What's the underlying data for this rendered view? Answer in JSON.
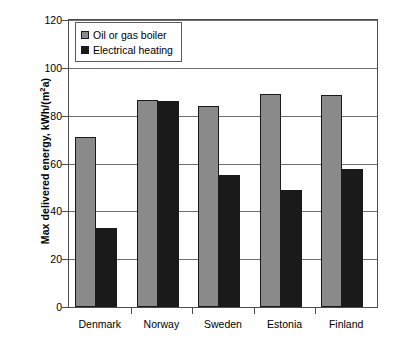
{
  "chart_data": {
    "type": "bar",
    "title": "",
    "xlabel": "",
    "ylabel": "Max delivered energy, kWh/(m2a)",
    "ylabel_prefix": "Max delivered energy, kWh/(m",
    "ylabel_exponent": "2",
    "ylabel_suffix": "a)",
    "categories": [
      "Denmark",
      "Norway",
      "Sweden",
      "Estonia",
      "Finland"
    ],
    "series": [
      {
        "name": "Oil or gas boiler",
        "color": "#8a8a8a",
        "values": [
          71,
          86.5,
          84,
          89,
          88.5
        ]
      },
      {
        "name": "Electrical heating",
        "color": "#1a1a1a",
        "values": [
          33,
          86,
          55,
          49,
          57.5
        ]
      }
    ],
    "ylim": [
      0,
      120
    ],
    "yticks": [
      0,
      20,
      40,
      60,
      80,
      100,
      120
    ],
    "ytick_labels": [
      "0",
      "20",
      "40",
      "60",
      "80",
      "100",
      "120"
    ],
    "grid": true,
    "grid_axis": "y",
    "legend_position": "upper left",
    "legend_entries": [
      "Oil or gas boiler",
      "Electrical heating"
    ]
  }
}
